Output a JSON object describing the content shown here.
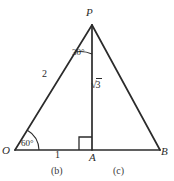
{
  "figure": {
    "type": "geometry-diagram",
    "background_color": "#ffffff",
    "stroke_color": "#2b2b2b",
    "vertices": {
      "P": {
        "label": "P",
        "x": 92,
        "y": 25
      },
      "O": {
        "label": "O",
        "x": 15,
        "y": 150
      },
      "A": {
        "label": "A",
        "x": 92,
        "y": 150
      },
      "B": {
        "label": "B",
        "x": 160,
        "y": 150
      }
    },
    "angles": [
      {
        "name": "angle-at-P",
        "label": "30°",
        "vertex": "P",
        "between": [
          "PO",
          "PA"
        ]
      },
      {
        "name": "angle-at-O",
        "label": "60°",
        "vertex": "O",
        "between": [
          "OP",
          "OB"
        ]
      },
      {
        "name": "right-angle-at-A",
        "label": "",
        "vertex": "A",
        "marker": "square"
      }
    ],
    "side_labels": [
      {
        "name": "side-OP",
        "label": "2"
      },
      {
        "name": "segment-OA",
        "label": "1"
      },
      {
        "name": "altitude-PA",
        "label": "√3",
        "radical_symbol": "√",
        "radicand": "3"
      }
    ],
    "captions": [
      {
        "name": "caption-b",
        "label": "(b)"
      },
      {
        "name": "caption-c",
        "label": "(c)"
      }
    ]
  }
}
